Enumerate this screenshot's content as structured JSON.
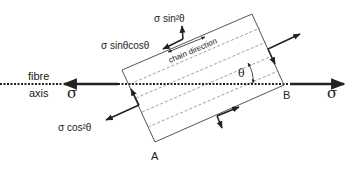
{
  "diagram": {
    "labels": {
      "fibre": "fibre",
      "axis": "axis",
      "sigma_left": "σ",
      "sigma_right": "σ",
      "sin2": "σ sin²θ",
      "sincos": "σ sinθcosθ",
      "cos2": "σ cos²θ",
      "chain_direction": "chain direction",
      "theta": "θ",
      "point_a": "A",
      "point_b": "B"
    },
    "colors": {
      "line": "#222222",
      "rect": "#555555",
      "dashed": "#888888"
    }
  }
}
